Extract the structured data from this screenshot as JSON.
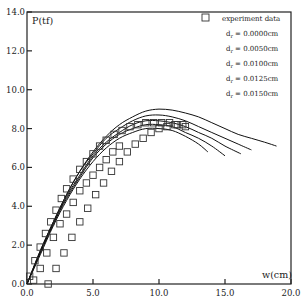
{
  "chart_data": {
    "type": "line",
    "title": "",
    "xlabel": "w(cm)",
    "ylabel": "P(tf)",
    "xlim": [
      0,
      20
    ],
    "ylim": [
      0,
      14
    ],
    "grid": false,
    "legend_position": "upper right (inside)",
    "x_ticks": [
      "0.0",
      "5.0",
      "10.0",
      "15.0",
      "20.0"
    ],
    "y_ticks": [
      "0.0",
      "2.0",
      "4.0",
      "6.0",
      "8.0",
      "10.0",
      "12.0",
      "14.0"
    ],
    "legend": [
      {
        "marker": "square",
        "label": "experiment data"
      },
      {
        "marker": "line",
        "label": "d_r = 0.0000cm"
      },
      {
        "marker": "line",
        "label": "d_r = 0.0050cm"
      },
      {
        "marker": "line",
        "label": "d_r = 0.0100cm"
      },
      {
        "marker": "line",
        "label": "d_r = 0.0125cm"
      },
      {
        "marker": "line",
        "label": "d_r = 0.0150cm"
      }
    ],
    "series": [
      {
        "name": "experiment data (set A)",
        "style": "square",
        "x": [
          0.2,
          0.6,
          1.0,
          1.4,
          1.8,
          2.2,
          2.6,
          3.0,
          3.5,
          4.0,
          4.5,
          5.0,
          5.5,
          6.0,
          6.6,
          7.2,
          7.8,
          8.4,
          9.0,
          9.6,
          10.2,
          10.8,
          11.4,
          12.0
        ],
        "y": [
          0.4,
          1.2,
          1.9,
          2.6,
          3.2,
          3.8,
          4.4,
          4.9,
          5.4,
          5.9,
          6.3,
          6.7,
          7.1,
          7.4,
          7.7,
          7.9,
          8.1,
          8.2,
          8.3,
          8.3,
          8.3,
          8.3,
          8.2,
          8.1
        ]
      },
      {
        "name": "experiment data (set B)",
        "style": "square",
        "x": [
          0.5,
          1.0,
          1.5,
          2.0,
          2.5,
          3.0,
          3.5,
          4.0,
          4.5,
          5.0,
          5.5,
          6.0,
          6.5,
          7.0
        ],
        "y": [
          0.2,
          0.8,
          1.6,
          2.4,
          3.1,
          3.6,
          4.2,
          4.8,
          5.2,
          5.6,
          6.0,
          6.4,
          6.8,
          7.1
        ]
      },
      {
        "name": "experiment data (set C)",
        "style": "square",
        "x": [
          1.6,
          2.2,
          2.8,
          3.4,
          4.0,
          4.6,
          5.2,
          5.8,
          6.4,
          7.0,
          7.6,
          8.2,
          8.8,
          9.4,
          10.0,
          10.6,
          11.2,
          11.8
        ],
        "y": [
          0.0,
          0.8,
          1.6,
          2.4,
          3.2,
          3.9,
          4.6,
          5.2,
          5.8,
          6.3,
          6.8,
          7.2,
          7.5,
          7.8,
          8.0,
          8.1,
          8.2,
          8.2
        ]
      },
      {
        "name": "d_r = 0.0000cm",
        "style": "line",
        "x": [
          0,
          1,
          2,
          3,
          4,
          5,
          6,
          7,
          8,
          9,
          10,
          11,
          12,
          13,
          14,
          15,
          16,
          17,
          18,
          18.9
        ],
        "y": [
          0,
          1.7,
          3.2,
          4.6,
          5.8,
          6.8,
          7.6,
          8.2,
          8.6,
          8.9,
          9.0,
          8.95,
          8.8,
          8.6,
          8.3,
          8.0,
          7.7,
          7.5,
          7.3,
          7.1
        ]
      },
      {
        "name": "d_r = 0.0050cm",
        "style": "line",
        "x": [
          0,
          1,
          2,
          3,
          4,
          5,
          6,
          7,
          8,
          9,
          10,
          11,
          12,
          13,
          14,
          15,
          16,
          17
        ],
        "y": [
          0,
          1.7,
          3.2,
          4.6,
          5.8,
          6.7,
          7.5,
          8.0,
          8.4,
          8.65,
          8.7,
          8.6,
          8.4,
          8.1,
          7.8,
          7.5,
          7.2,
          6.9
        ]
      },
      {
        "name": "d_r = 0.0100cm",
        "style": "line",
        "x": [
          0,
          1,
          2,
          3,
          4,
          5,
          6,
          7,
          8,
          9,
          10,
          11,
          12,
          13,
          14,
          15,
          16.2
        ],
        "y": [
          0,
          1.6,
          3.1,
          4.5,
          5.6,
          6.6,
          7.3,
          7.8,
          8.2,
          8.4,
          8.4,
          8.3,
          8.1,
          7.8,
          7.5,
          7.1,
          6.7
        ]
      },
      {
        "name": "d_r = 0.0125cm",
        "style": "line",
        "x": [
          0,
          1,
          2,
          3,
          4,
          5,
          6,
          7,
          8,
          9,
          10,
          11,
          12,
          13,
          14,
          15
        ],
        "y": [
          0,
          1.6,
          3.1,
          4.4,
          5.5,
          6.5,
          7.2,
          7.7,
          8.0,
          8.2,
          8.2,
          8.1,
          7.8,
          7.5,
          7.1,
          6.6
        ]
      },
      {
        "name": "d_r = 0.0150cm",
        "style": "line",
        "x": [
          0,
          1,
          2,
          3,
          4,
          5,
          6,
          7,
          8,
          9,
          10,
          11,
          12,
          13,
          13.7
        ],
        "y": [
          0,
          1.5,
          3.0,
          4.3,
          5.4,
          6.3,
          7.0,
          7.5,
          7.8,
          8.0,
          8.0,
          7.9,
          7.6,
          7.2,
          6.8
        ]
      }
    ]
  }
}
